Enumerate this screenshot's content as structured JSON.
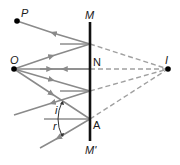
{
  "diagram": {
    "labels": {
      "P": "P",
      "O": "O",
      "M": "M",
      "N": "N",
      "I": "I",
      "A": "A",
      "M_prime": "M'",
      "i": "i",
      "r": "r"
    },
    "colors": {
      "ray": "#8a8a8a",
      "virtual_ray": "#9a9a9a",
      "mirror": "#111111",
      "point": "#000000",
      "normal": "#555555",
      "text": "#1a1a1a"
    },
    "points": {
      "P": [
        17,
        21
      ],
      "O": [
        14,
        69
      ],
      "I": [
        168,
        69
      ],
      "mirror_top": [
        90,
        22
      ],
      "mirror_bottom": [
        90,
        141
      ],
      "reflect_upper": [
        90,
        44
      ],
      "reflect_N": [
        90,
        69
      ],
      "reflect_lower": [
        90,
        91
      ],
      "reflect_A": [
        90,
        119
      ]
    }
  }
}
